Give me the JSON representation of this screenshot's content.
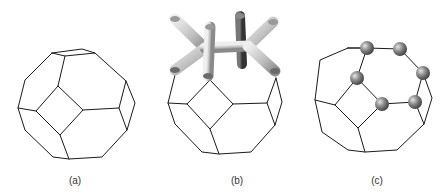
{
  "figure": {
    "panels": [
      {
        "id": "a",
        "label": "(a)",
        "description": "Truncated octahedron wireframe"
      },
      {
        "id": "b",
        "label": "(b)",
        "description": "Truncated octahedron with tube/strut network on top"
      },
      {
        "id": "c",
        "label": "(c)",
        "description": "Truncated octahedron with spheres at vertices of one hexagonal face"
      }
    ]
  },
  "colors": {
    "edge": "#1a1a1a",
    "tube_light": "#d8d8d8",
    "tube_mid": "#a8a8a8",
    "tube_dark": "#5a5a5a",
    "sphere": "#7a7a7a"
  }
}
